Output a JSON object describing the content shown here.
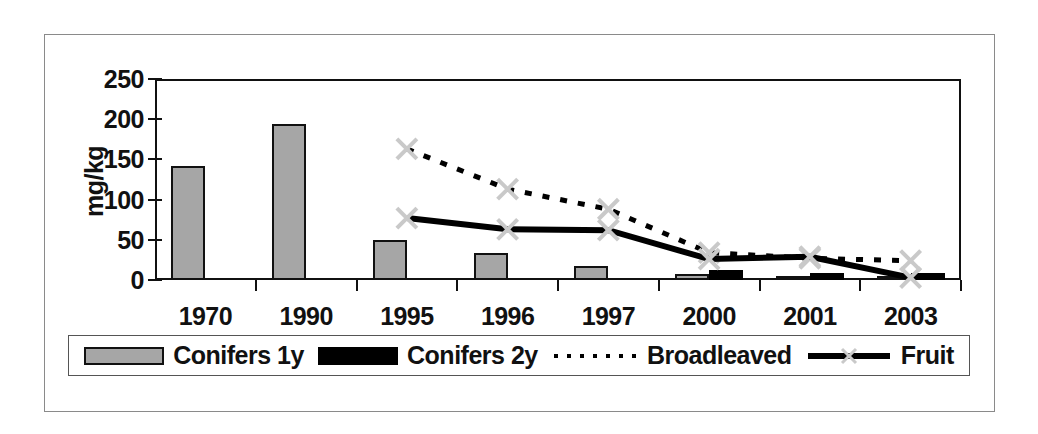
{
  "chart_data": {
    "type": "bar",
    "title": "",
    "xlabel": "",
    "ylabel": "mg/kg",
    "ylim": [
      0,
      250
    ],
    "ytick_values": [
      0,
      50,
      100,
      150,
      200,
      250
    ],
    "ytick_labels": [
      "0",
      "50",
      "100",
      "150",
      "200",
      "250"
    ],
    "grid": false,
    "legend_position": "bottom",
    "categories": [
      "1970",
      "1990",
      "1995",
      "1996",
      "1997",
      "2000",
      "2001",
      "2003"
    ],
    "series": [
      {
        "name": "Conifers 1y",
        "kind": "bar",
        "color": "#a6a6a6",
        "edge_color": "#111111",
        "values": [
          142,
          194,
          50,
          33,
          17,
          8,
          5,
          3
        ]
      },
      {
        "name": "Conifers 2y",
        "kind": "bar",
        "color": "#000000",
        "edge_color": "#000000",
        "values": [
          null,
          null,
          null,
          null,
          null,
          13,
          9,
          9
        ]
      },
      {
        "name": "Broadleaved",
        "kind": "line",
        "style": "dotted",
        "color": "#000000",
        "marker": "x",
        "values": [
          null,
          null,
          163,
          113,
          88,
          34,
          27,
          24
        ]
      },
      {
        "name": "Fruit",
        "kind": "line",
        "style": "solid",
        "color": "#000000",
        "marker": "x",
        "values": [
          null,
          null,
          77,
          63,
          62,
          26,
          29,
          3
        ]
      }
    ]
  },
  "legend": {
    "items": [
      {
        "label": "Conifers 1y",
        "swatch": "gray-bar-swatch"
      },
      {
        "label": "Conifers 2y",
        "swatch": "black-bar-swatch"
      },
      {
        "label": "Broadleaved",
        "swatch": "dotted-line-swatch"
      },
      {
        "label": "Fruit",
        "swatch": "solid-line-x-swatch"
      }
    ]
  },
  "axis": {
    "y_title": "mg/kg",
    "y_ticks": [
      "250",
      "200",
      "150",
      "100",
      "50",
      "0"
    ],
    "x_ticks": [
      "1970",
      "1990",
      "1995",
      "1996",
      "1997",
      "2000",
      "2001",
      "2003"
    ]
  }
}
